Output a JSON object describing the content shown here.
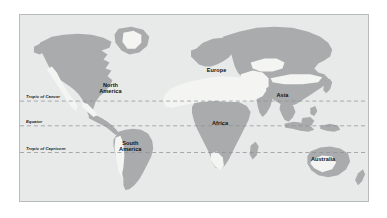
{
  "figure": {
    "kind": "world-map",
    "background_color": "#ffffff",
    "frame_border_color": "#b9bcbe"
  },
  "map": {
    "ocean_color": "#e8eaea",
    "land_color": "#a9abac",
    "desert_color": "#f4f5f3",
    "graticule_color": "#9aa0a6"
  },
  "latitude_lines": [
    {
      "label": "Tropic of Cancer",
      "y_pct": 46.3,
      "style": "dashed"
    },
    {
      "label": "Equator",
      "y_pct": 59.6,
      "style": "dashed"
    },
    {
      "label": "Tropic of Capricorn",
      "y_pct": 74.0,
      "style": "dashed"
    }
  ],
  "continents": [
    {
      "label": "North\nAmerica",
      "x_pct": 26.0,
      "y_pct": 39.0
    },
    {
      "label": "South\nAmerica",
      "x_pct": 31.7,
      "y_pct": 70.5
    },
    {
      "label": "Europe",
      "x_pct": 56.5,
      "y_pct": 29.5
    },
    {
      "label": "Africa",
      "x_pct": 57.5,
      "y_pct": 58.0
    },
    {
      "label": "Asia",
      "x_pct": 75.4,
      "y_pct": 43.0
    },
    {
      "label": "Australia",
      "x_pct": 87.1,
      "y_pct": 77.5
    }
  ]
}
